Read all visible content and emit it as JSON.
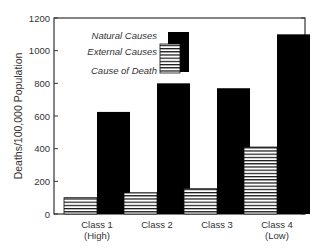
{
  "chart_data": {
    "type": "bar",
    "title": "",
    "xlabel": "",
    "ylabel": "Deaths/100,000 Population",
    "ylim": [
      0,
      1200
    ],
    "yticks": [
      0,
      200,
      400,
      600,
      800,
      1000,
      1200
    ],
    "grid": false,
    "categories": [
      "Class 1\n(High)",
      "Class 2",
      "Class 3",
      "Class 4\n(Low)"
    ],
    "category_lines": [
      [
        "Class 1",
        "(High)"
      ],
      [
        "Class 2"
      ],
      [
        "Class 3"
      ],
      [
        "Class 4",
        "(Low)"
      ]
    ],
    "series": [
      {
        "name": "External Causes",
        "pattern": "horizontal-stripes",
        "values": [
          100,
          130,
          155,
          410
        ]
      },
      {
        "name": "Natural Causes",
        "pattern": "solid-black",
        "values": [
          625,
          800,
          770,
          1100
        ]
      }
    ],
    "legend": {
      "position": "upper-left-inside",
      "title": "Cause of Death",
      "entries": [
        "Natural Causes",
        "External Causes"
      ]
    }
  },
  "colors": {
    "solid": "#000000",
    "stripe": "#111111",
    "background": "#ffffff",
    "axis": "#333333"
  }
}
